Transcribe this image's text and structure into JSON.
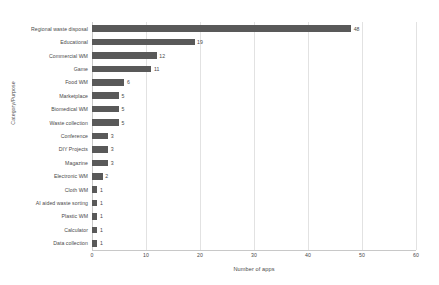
{
  "chart_data": {
    "type": "bar",
    "orientation": "horizontal",
    "title": "",
    "xlabel": "Number of apps",
    "ylabel": "Category/Purpose",
    "xlim": [
      0,
      60
    ],
    "xticks": [
      0,
      10,
      20,
      30,
      40,
      50,
      60
    ],
    "grid": true,
    "legend": false,
    "bar_color": "#595959",
    "categories": [
      "Regional waste disposal",
      "Educational",
      "Commercial WM",
      "Game",
      "Food WM",
      "Marketplace",
      "Biomedical WM",
      "Waste collection",
      "Conference",
      "DIY Projects",
      "Magazine",
      "Electronic WM",
      "Cloth WM",
      "AI aided waste sorting",
      "Plastic WM",
      "Calculator",
      "Data collection"
    ],
    "values": [
      48,
      19,
      12,
      11,
      6,
      5,
      5,
      5,
      3,
      3,
      3,
      2,
      1,
      1,
      1,
      1,
      1
    ]
  }
}
